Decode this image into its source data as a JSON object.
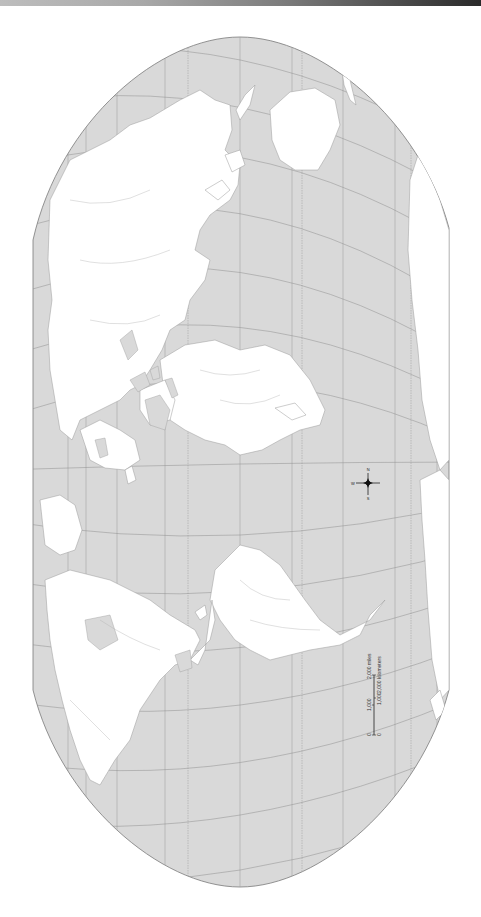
{
  "map": {
    "title": "",
    "orientation": "north-left (rotated 90°)",
    "projection_shape": "pseudocylindrical (Robinson-like)",
    "colors": {
      "ocean": "#d9d9d9",
      "land": "#ffffff",
      "graticule": "#8f8f8f",
      "border": "#7a7a7a",
      "rivers": "#a0a0a0",
      "top_band_dark": "#2a2a2a"
    }
  },
  "compass": {
    "icon": "compass-rose-icon",
    "labels": {
      "north": "N",
      "south": "S",
      "east": "E",
      "west": "W"
    }
  },
  "scale_bar": {
    "miles_ticks": [
      "0",
      "1,000",
      "2,000 miles"
    ],
    "km_ticks": [
      "0",
      "1,000",
      "2,000 kilometers"
    ]
  }
}
